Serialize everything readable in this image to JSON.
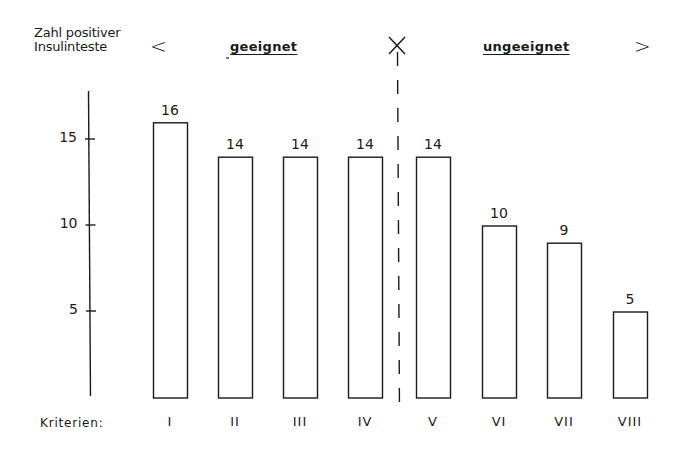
{
  "chart_data": {
    "type": "bar",
    "title": "",
    "ylabel": "Zahl positiver Insulinteste",
    "xlabel": "Kriterien:",
    "categories": [
      "I",
      "II",
      "III",
      "IV",
      "V",
      "VI",
      "VII",
      "VIII"
    ],
    "values": [
      16,
      14,
      14,
      14,
      14,
      10,
      9,
      5
    ],
    "value_labels": [
      "16",
      "14",
      "14",
      "14",
      "14",
      "10",
      "9",
      "5"
    ],
    "yticks": [
      5,
      10,
      15
    ],
    "ytick_labels": [
      "5",
      "10",
      "15"
    ],
    "ylim": [
      0,
      17.5
    ],
    "grid": false,
    "bar_style": "outlined",
    "groups": [
      {
        "label": "geeignet",
        "categories": [
          "I",
          "II",
          "III",
          "IV"
        ],
        "bracket": "<"
      },
      {
        "label": "ungeeignet",
        "categories": [
          "V",
          "VI",
          "VII",
          "VIII"
        ],
        "bracket": ">"
      }
    ],
    "divider": {
      "style": "dashed",
      "marker": "×",
      "between": [
        "IV",
        "V"
      ]
    }
  },
  "labels": {
    "ylabel_line1": "Zahl positiver",
    "ylabel_line2": "Insulinteste",
    "left_bracket": "<",
    "right_bracket": ">",
    "group_left": "geeignet",
    "group_right": "ungeeignet",
    "divider_marker": "×",
    "xlabel": "Kriterien:"
  },
  "colors": {
    "ink": "#1a1a1a",
    "background": "#ffffff"
  }
}
